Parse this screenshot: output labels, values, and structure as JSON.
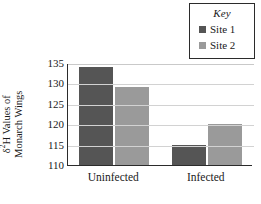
{
  "legend": {
    "title": "Key",
    "items": [
      {
        "label": "Site 1",
        "color": "#555555",
        "swatch_name": "legend-swatch-site-1"
      },
      {
        "label": "Site 2",
        "color": "#9a9a9a",
        "swatch_name": "legend-swatch-site-2"
      }
    ]
  },
  "axis": {
    "y_title_line1": "δ²H Values of",
    "y_title_line2": "Monarch Wings",
    "y_title_full": "δ²H Values of Monarch Wings",
    "y_ticks": [
      "135",
      "130",
      "125",
      "120",
      "115",
      "110"
    ]
  },
  "chart_data": {
    "type": "bar",
    "title": "",
    "xlabel": "",
    "ylabel": "δ²H Values of Monarch Wings",
    "categories": [
      "Uninfected",
      "Infected"
    ],
    "series": [
      {
        "name": "Site 1",
        "color": "#555555",
        "values": [
          134,
          115
        ]
      },
      {
        "name": "Site 2",
        "color": "#9a9a9a",
        "values": [
          129,
          120
        ]
      }
    ],
    "ylim": [
      110,
      135
    ],
    "ytick_step": 5,
    "ytick_values": [
      110,
      115,
      120,
      125,
      130,
      135
    ],
    "grid": "horizontal",
    "legend_position": "top-right",
    "legend_title": "Key"
  }
}
